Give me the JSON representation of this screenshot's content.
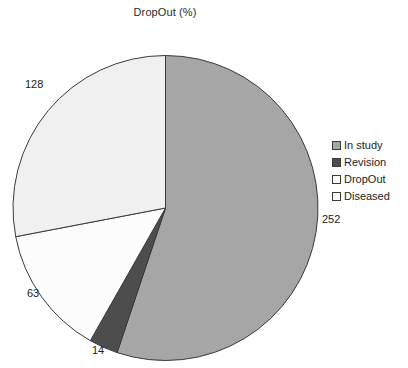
{
  "chart_data": {
    "type": "pie",
    "title": "DropOut (%)",
    "categories": [
      "In study",
      "Revision",
      "DropOut",
      "Diseased"
    ],
    "values": [
      252,
      14,
      63,
      128
    ],
    "total": 457,
    "data_labels": [
      "252",
      "14",
      "63",
      "128"
    ],
    "colors": [
      "#a6a6a6",
      "#4d4d4d",
      "#fcfcfc",
      "#f0f0f0"
    ],
    "slice_border_color": "#3a3a3a",
    "start_angle_deg": 0,
    "direction": "clockwise",
    "legend_position": "right",
    "grid": false,
    "xlabel": "",
    "ylabel": ""
  },
  "legend": {
    "items": [
      {
        "label": "In study",
        "swatch": "#a6a6a6"
      },
      {
        "label": "Revision",
        "swatch": "#4d4d4d"
      },
      {
        "label": "DropOut",
        "swatch": "#ffffff"
      },
      {
        "label": "Diseased",
        "swatch": "#fafafa"
      }
    ]
  },
  "labels": {
    "in_study": "252",
    "revision": "14",
    "dropout": "63",
    "diseased": "128"
  }
}
